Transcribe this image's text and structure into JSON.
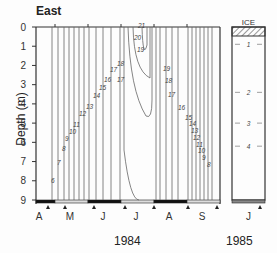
{
  "chart_data": {
    "type": "heatmap",
    "subtype": "isotherm contour plot (depth-time)",
    "title": "East",
    "ylabel": "Depth (m)",
    "yticks": [
      0,
      1,
      2,
      3,
      4,
      5,
      6,
      7,
      8,
      9
    ],
    "ylim": [
      9,
      0
    ],
    "panels": [
      {
        "year_label": "1984",
        "xticks": [
          "A",
          "M",
          "J",
          "J",
          "A",
          "S"
        ],
        "contour_labels_left_limb": [
          6,
          7,
          8,
          9,
          10,
          11,
          12,
          13,
          14,
          15,
          16,
          17,
          18,
          19,
          20,
          21
        ],
        "contour_labels_right_limb": [
          19,
          18,
          17,
          16,
          15,
          14,
          13,
          12,
          11,
          10,
          9,
          8
        ],
        "max_isotherm": 21,
        "grid": false
      },
      {
        "year_label": "1985",
        "xticks": [
          "J"
        ],
        "ice_label": "ICE",
        "contour_labels": [
          1,
          2,
          3,
          4
        ],
        "contour_depths_m": [
          0.9,
          3.4,
          5.0,
          6.2
        ]
      }
    ]
  },
  "labels": {
    "title": "East",
    "ylabel": "Depth (m)",
    "year1": "1984",
    "year2": "1985",
    "ice": "ICE"
  }
}
